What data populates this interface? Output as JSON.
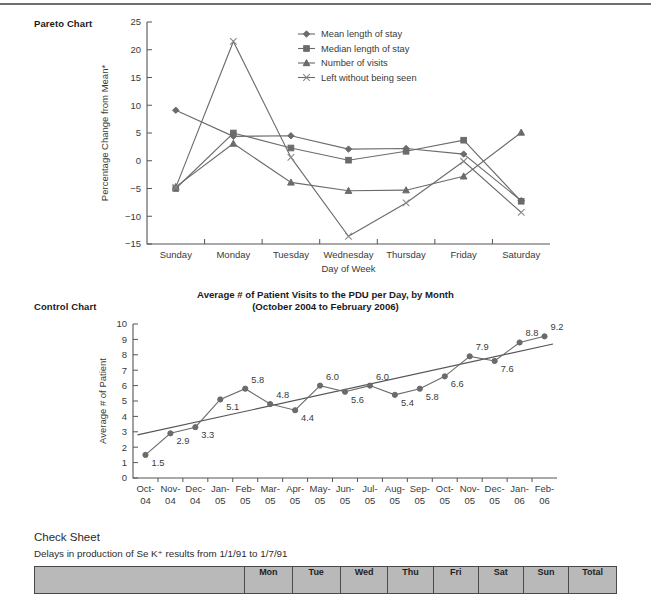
{
  "page": {
    "pareto_side_label": "Pareto Chart",
    "control_side_label": "Control Chart"
  },
  "check_sheet": {
    "heading": "Check Sheet",
    "subheading": "Delays in production of Se K⁺ results from 1/1/91 to 1/7/91",
    "columns": [
      "",
      "Mon",
      "Tue",
      "Wed",
      "Thu",
      "Fri",
      "Sat",
      "Sun",
      "Total"
    ]
  },
  "chart_data": [
    {
      "type": "line",
      "name": "pareto-chart",
      "title": "",
      "xlabel": "Day of Week",
      "ylabel": "Percentage Change from Mean*",
      "categories": [
        "Sunday",
        "Monday",
        "Tuesday",
        "Wednesday",
        "Thursday",
        "Friday",
        "Saturday"
      ],
      "ylim": [
        -15,
        25
      ],
      "yticks": [
        -15,
        -10,
        -5,
        0,
        5,
        10,
        15,
        20,
        25
      ],
      "grid": false,
      "legend_position": "top-right",
      "series": [
        {
          "name": "Mean length of stay",
          "marker": "diamond",
          "values": [
            9.1,
            4.4,
            4.5,
            2.1,
            2.2,
            1.2,
            -7.2
          ]
        },
        {
          "name": "Median length of stay",
          "marker": "square",
          "values": [
            -5.0,
            5.0,
            2.3,
            0.1,
            1.7,
            3.7,
            -7.3
          ]
        },
        {
          "name": "Number of visits",
          "marker": "triangle",
          "values": [
            -4.7,
            3.1,
            -3.9,
            -5.4,
            -5.3,
            -2.8,
            5.1
          ]
        },
        {
          "name": "Left without being seen",
          "marker": "cross",
          "values": [
            -4.8,
            21.5,
            0.6,
            -13.6,
            -7.6,
            -0.1,
            -9.3
          ]
        }
      ]
    },
    {
      "type": "line",
      "name": "control-chart",
      "title_line1": "Average # of Patient Visits to the PDU per Day, by Month",
      "title_line2": "(October 2004 to February 2006)",
      "xlabel": "",
      "ylabel": "Average # of Patient",
      "categories": [
        "Oct-\n04",
        "Nov-\n04",
        "Dec-\n04",
        "Jan-\n05",
        "Feb-\n05",
        "Mar-\n05",
        "Apr-\n05",
        "May-\n05",
        "Jun-\n05",
        "Jul-\n05",
        "Aug-\n05",
        "Sep-\n05",
        "Oct-\n05",
        "Nov-\n05",
        "Dec-\n05",
        "Jan-\n06",
        "Feb-\n06"
      ],
      "category_labels": [
        [
          "Oct-",
          "04"
        ],
        [
          "Nov-",
          "04"
        ],
        [
          "Dec-",
          "04"
        ],
        [
          "Jan-",
          "05"
        ],
        [
          "Feb-",
          "05"
        ],
        [
          "Mar-",
          "05"
        ],
        [
          "Apr-",
          "05"
        ],
        [
          "May-",
          "05"
        ],
        [
          "Jun-",
          "05"
        ],
        [
          "Jul-",
          "05"
        ],
        [
          "Aug-",
          "05"
        ],
        [
          "Sep-",
          "05"
        ],
        [
          "Oct-",
          "05"
        ],
        [
          "Nov-",
          "05"
        ],
        [
          "Dec-",
          "05"
        ],
        [
          "Jan-",
          "06"
        ],
        [
          "Feb-",
          "06"
        ]
      ],
      "ylim": [
        0,
        10
      ],
      "yticks": [
        0,
        1,
        2,
        3,
        4,
        5,
        6,
        7,
        8,
        9,
        10
      ],
      "grid": false,
      "values": [
        1.5,
        2.9,
        3.3,
        5.1,
        5.8,
        4.8,
        4.4,
        6.0,
        5.6,
        6.0,
        5.4,
        5.8,
        6.6,
        7.9,
        7.6,
        8.8,
        9.2
      ],
      "data_labels": [
        "1.5",
        "2.9",
        "3.3",
        "5.1",
        "5.8",
        "4.8",
        "4.4",
        "6.0",
        "5.6",
        "6.0",
        "5.4",
        "5.8",
        "6.6",
        "7.9",
        "7.6",
        "8.8",
        "9.2"
      ],
      "trendline": {
        "start": 2.8,
        "end": 8.7
      }
    }
  ]
}
